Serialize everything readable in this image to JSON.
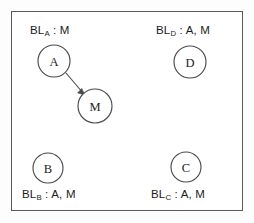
{
  "diagram": {
    "frame": {
      "border_color": "#5a5a5a",
      "background": "#ffffff"
    },
    "stroke_color": "#4a4a4a",
    "text_color": "#1c1c1c",
    "nodes": [
      {
        "id": "A",
        "label": "A",
        "cx": 54,
        "cy": 61,
        "r": 16
      },
      {
        "id": "M",
        "label": "M",
        "cx": 95,
        "cy": 106,
        "r": 17
      },
      {
        "id": "D",
        "label": "D",
        "cx": 190,
        "cy": 62,
        "r": 16
      },
      {
        "id": "B",
        "label": "B",
        "cx": 48,
        "cy": 168,
        "r": 15
      },
      {
        "id": "C",
        "label": "C",
        "cx": 186,
        "cy": 167,
        "r": 15
      }
    ],
    "edges": [
      {
        "from": "A",
        "to": "M",
        "directed": true
      }
    ],
    "labels": [
      {
        "id": "BL_A",
        "prefix": "BL",
        "subscript": "A",
        "separator": " : ",
        "value": "M",
        "full_text": "BL_A : M",
        "for_node": "A"
      },
      {
        "id": "BL_D",
        "prefix": "BL",
        "subscript": "D",
        "separator": " : ",
        "value": "A, M",
        "full_text": "BL_D : A, M",
        "for_node": "D"
      },
      {
        "id": "BL_B",
        "prefix": "BL",
        "subscript": "B",
        "separator": " : ",
        "value": "A, M",
        "full_text": "BL_B : A, M",
        "for_node": "B"
      },
      {
        "id": "BL_C",
        "prefix": "BL",
        "subscript": "C",
        "separator": " : ",
        "value": "A, M",
        "full_text": "BL_C : A, M",
        "for_node": "C"
      }
    ]
  }
}
